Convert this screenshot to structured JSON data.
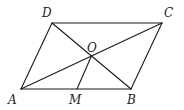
{
  "diagram": {
    "type": "geometry-parallelogram",
    "stroke_color": "#1a1a1a",
    "points": {
      "A": {
        "x": 21,
        "y": 89,
        "label": "A",
        "lx": 8,
        "ly": 104
      },
      "B": {
        "x": 131,
        "y": 89,
        "label": "B",
        "lx": 127,
        "ly": 104
      },
      "C": {
        "x": 162,
        "y": 23,
        "label": "C",
        "lx": 164,
        "ly": 17
      },
      "D": {
        "x": 52,
        "y": 23,
        "label": "D",
        "lx": 42,
        "ly": 17
      },
      "O": {
        "x": 91,
        "y": 57,
        "label": "O",
        "lx": 87,
        "ly": 52
      },
      "M": {
        "x": 77,
        "y": 89,
        "label": "M",
        "lx": 69,
        "ly": 104
      }
    },
    "segments": [
      [
        "A",
        "B"
      ],
      [
        "B",
        "C"
      ],
      [
        "C",
        "D"
      ],
      [
        "D",
        "A"
      ],
      [
        "A",
        "C"
      ],
      [
        "B",
        "D"
      ],
      [
        "O",
        "M"
      ]
    ]
  }
}
